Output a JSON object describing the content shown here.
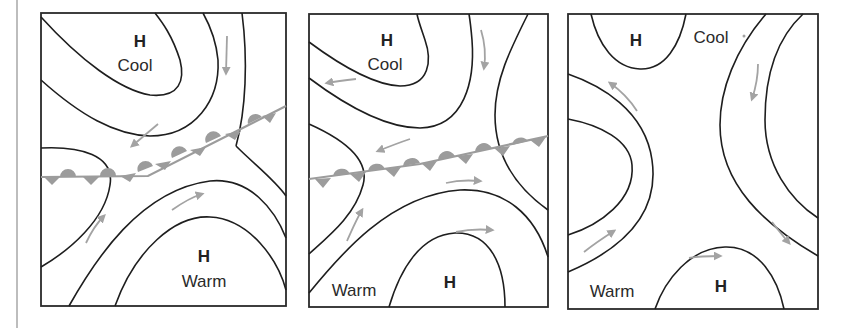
{
  "figure": {
    "colors": {
      "isobar": "#1e1e1e",
      "front": "#9c9c9c",
      "wind_arrow": "#a3a3a3",
      "border": "#2a2a2a",
      "background": "#ffffff"
    },
    "panels": [
      {
        "id": 1,
        "labels": {
          "high_top": "H",
          "top_air": "Cool",
          "high_bottom": "H",
          "bottom_air": "Warm"
        },
        "front": "stationary",
        "wind_arrows": 4
      },
      {
        "id": 2,
        "labels": {
          "high_top": "H",
          "top_air": "Cool",
          "high_bottom": "H",
          "bottom_air": "Warm"
        },
        "front": "stationary",
        "wind_arrows": 6
      },
      {
        "id": 3,
        "labels": {
          "high_top": "H",
          "top_air": "Cool",
          "high_bottom": "H",
          "bottom_air": "Warm"
        },
        "front": "none",
        "wind_arrows": 5
      }
    ]
  }
}
